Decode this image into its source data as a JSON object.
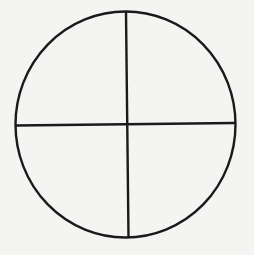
{
  "diagram": {
    "type": "circle-divided-into-quadrants",
    "background": "#f4f4f2",
    "stroke_color": "#1a1a1a",
    "stroke_width": 2.4,
    "circle": {
      "cx": 125.5,
      "cy": 124.5,
      "rx": 110,
      "ry": 113
    },
    "vertical_divider": {
      "x1": 126,
      "y1": 12,
      "x2": 128.5,
      "y2": 237
    },
    "horizontal_divider": {
      "x1": 16,
      "y1": 125.5,
      "x2": 235,
      "y2": 123
    },
    "quadrants": 4
  }
}
